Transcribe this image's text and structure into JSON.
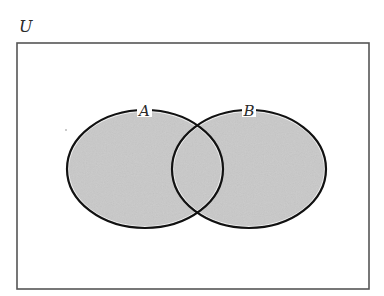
{
  "diagram": {
    "type": "venn",
    "universe": {
      "label": "U",
      "rect": {
        "x": 17,
        "y": 43,
        "width": 352,
        "height": 246
      },
      "stroke": "#555555",
      "fill": "#ffffff"
    },
    "sets": [
      {
        "id": "A",
        "label": "A",
        "cx": 145,
        "cy": 169,
        "rx": 78,
        "ry": 59
      },
      {
        "id": "B",
        "label": "B",
        "cx": 249,
        "cy": 169,
        "rx": 77,
        "ry": 59
      }
    ],
    "shaded_region": "A ∪ B",
    "shade_color": "#c9c9c9",
    "outline_color": "#111111"
  }
}
